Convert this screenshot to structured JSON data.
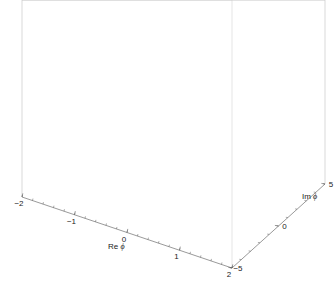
{
  "chart_data": {
    "type": "surface3d",
    "title": "",
    "xlabel": "Re ϕ",
    "ylabel": "Im ϕ",
    "zlabel": "",
    "x_range": [
      -2,
      2
    ],
    "y_range": [
      -5,
      5
    ],
    "x_ticks": [
      {
        "value": -2,
        "label": "−2"
      },
      {
        "value": -1,
        "label": "−1"
      },
      {
        "value": 0,
        "label": "0"
      },
      {
        "value": 1,
        "label": "1"
      },
      {
        "value": 2,
        "label": "2"
      }
    ],
    "y_ticks": [
      {
        "value": -5,
        "label": "−5"
      },
      {
        "value": 0,
        "label": "0"
      },
      {
        "value": 5,
        "label": "5"
      }
    ],
    "mesh": {
      "nx": 20,
      "ny": 20
    },
    "surface_description": "Double-well / Mexican-hat style potential V(Reϕ, Imϕ) rising steeply at large Reϕ and large Imϕ, with a trough near Reϕ ≈ ±1",
    "surface_color": "#a9a9a9",
    "mesh_color": "#3a3a3a",
    "box_color": "#c8c8c8",
    "axes_visible": {
      "z": false
    },
    "grid": false,
    "legend": null
  },
  "projection": {
    "origin_front": [
      232,
      268
    ],
    "x_vec": [
      -52.5,
      -17.75
    ],
    "y_vec": [
      9.3,
      -8.4
    ],
    "z_scale": 62,
    "z_max": 1.9
  }
}
